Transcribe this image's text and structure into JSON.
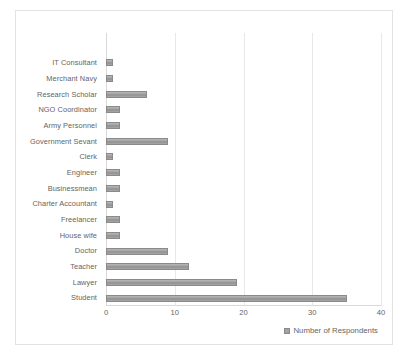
{
  "chart_data": {
    "type": "bar",
    "orientation": "horizontal",
    "title": "",
    "xlabel": "",
    "ylabel": "",
    "xlim": [
      0,
      40
    ],
    "xticks": [
      0,
      10,
      20,
      30,
      40
    ],
    "grid": true,
    "legend_position": "bottom-right",
    "categories": [
      "IT Consultant",
      "Merchant Navy",
      "Research Scholar",
      "NGO Coordinator",
      "Army Personnel",
      "Government Sevant",
      "Clerk",
      "Engineer",
      "Businessmean",
      "Charter Accountant",
      "Freelancer",
      "House wife",
      "Doctor",
      "Teacher",
      "Lawyer",
      "Student"
    ],
    "series": [
      {
        "name": "Number of Respondents",
        "values": [
          1,
          1,
          6,
          2,
          2,
          9,
          1,
          2,
          2,
          1,
          2,
          2,
          9,
          12,
          19,
          35
        ]
      }
    ]
  },
  "legend": {
    "marker_icon": "legend-square-icon",
    "label": "Number of Respondents"
  },
  "colors": {
    "bar_fill": "#a0a0a0",
    "bar_edge": "#8a8a8a",
    "gridline": "#e8e8e8",
    "axis": "#d9d9d9",
    "text": "#646464",
    "frame_border": "#e2e2e2",
    "background": "#ffffff"
  }
}
